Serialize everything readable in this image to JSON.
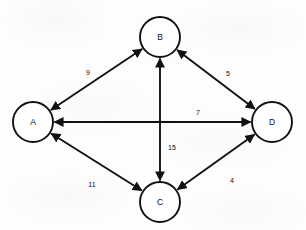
{
  "figure": {
    "kind": "weighted-undirected-graph-diagram",
    "background_color": "#fdfdfd",
    "ink_color": "#111111",
    "width": 306,
    "height": 230
  },
  "graph": {
    "node_radius": 20,
    "nodes": [
      {
        "id": "A",
        "label": "A",
        "cx": 33,
        "cy": 122
      },
      {
        "id": "B",
        "label": "B",
        "cx": 160,
        "cy": 37
      },
      {
        "id": "C",
        "label": "C",
        "cx": 160,
        "cy": 202
      },
      {
        "id": "D",
        "label": "D",
        "cx": 272,
        "cy": 122
      }
    ],
    "edges": [
      {
        "id": "AB",
        "from": "A",
        "to": "B",
        "weight": "9",
        "arrows": "both",
        "label_x": 88,
        "label_y": 72
      },
      {
        "id": "BD",
        "from": "B",
        "to": "D",
        "weight": "5",
        "arrows": "both",
        "label_x": 228,
        "label_y": 73
      },
      {
        "id": "AD",
        "from": "A",
        "to": "D",
        "weight": "7",
        "arrows": "both",
        "label_x": 198,
        "label_y": 112
      },
      {
        "id": "BC",
        "from": "B",
        "to": "C",
        "weight": "15",
        "arrows": "both",
        "label_x": 172,
        "label_y": 147
      },
      {
        "id": "AC",
        "from": "A",
        "to": "C",
        "weight": "11",
        "arrows": "both",
        "label_x": 92,
        "label_y": 184
      },
      {
        "id": "CD",
        "from": "C",
        "to": "D",
        "weight": "4",
        "arrows": "both",
        "label_x": 232,
        "label_y": 180
      }
    ]
  }
}
